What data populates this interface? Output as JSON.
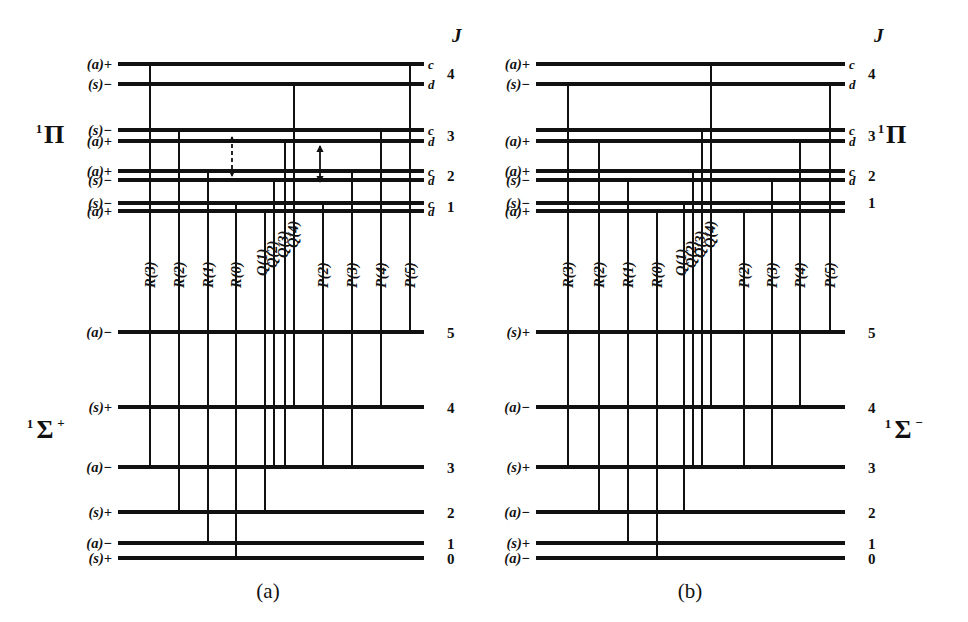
{
  "figure": {
    "caption_a": "(a)",
    "caption_b": "(b)",
    "j_header": "J",
    "axis_label_J": "J"
  },
  "panels": [
    {
      "id": "a",
      "caption": "(a)",
      "upper_term_sup": "1",
      "upper_term_symbol": "Π",
      "upper_term_charge": "",
      "lower_term_sup": "1",
      "lower_term_symbol": "Σ",
      "lower_term_charge": "+",
      "upper_levels": [
        {
          "J": "4",
          "cd": "c",
          "parity": "(a)+",
          "y": 64
        },
        {
          "J": "4",
          "cd": "d",
          "parity": "(s)−",
          "y": 84
        },
        {
          "J": "3",
          "cd": "c",
          "parity": "(s)−",
          "y": 130
        },
        {
          "J": "3",
          "cd": "d",
          "parity": "(a)+",
          "y": 141
        },
        {
          "J": "2",
          "cd": "c",
          "parity": "(a)+",
          "y": 171
        },
        {
          "J": "2",
          "cd": "d",
          "parity": "(s)−",
          "y": 180
        },
        {
          "J": "1",
          "cd": "c",
          "parity": "(s)−",
          "y": 203
        },
        {
          "J": "1",
          "cd": "d",
          "parity": "(a)+",
          "y": 211
        }
      ],
      "lower_levels": [
        {
          "J": "5",
          "parity": "(a)−",
          "y": 332
        },
        {
          "J": "4",
          "parity": "(s)+",
          "y": 407
        },
        {
          "J": "3",
          "parity": "(a)−",
          "y": 467
        },
        {
          "J": "2",
          "parity": "(s)+",
          "y": 512
        },
        {
          "J": "1",
          "parity": "(a)−",
          "y": 543
        },
        {
          "J": "0",
          "parity": "(s)+",
          "y": 558
        }
      ],
      "transitions": [
        {
          "label": "R(3)",
          "x": 150,
          "upper_y": 64,
          "lower_y": 467,
          "label_x": 150,
          "label_y": 288
        },
        {
          "label": "R(2)",
          "x": 179,
          "upper_y": 130,
          "lower_y": 512,
          "label_x": 179,
          "label_y": 288
        },
        {
          "label": "R(1)",
          "x": 208,
          "upper_y": 171,
          "lower_y": 543,
          "label_x": 208,
          "label_y": 288
        },
        {
          "label": "R(0)",
          "x": 236,
          "upper_y": 203,
          "lower_y": 558,
          "label_x": 236,
          "label_y": 288
        },
        {
          "label": "Q(1)",
          "x": 265,
          "upper_y": 211,
          "lower_y": 512,
          "label_x": 262,
          "label_y": 276
        },
        {
          "label": "Q(2)",
          "x": 274,
          "upper_y": 180,
          "lower_y": 467,
          "label_x": 272,
          "label_y": 268
        },
        {
          "label": "Q(3)",
          "x": 285,
          "upper_y": 141,
          "lower_y": 467,
          "label_x": 283,
          "label_y": 258
        },
        {
          "label": "Q(4)",
          "x": 294,
          "upper_y": 84,
          "lower_y": 407,
          "label_x": 293,
          "label_y": 248
        },
        {
          "label": "P(2)",
          "x": 323,
          "upper_y": 203,
          "lower_y": 467,
          "label_x": 323,
          "label_y": 288
        },
        {
          "label": "P(3)",
          "x": 352,
          "upper_y": 171,
          "lower_y": 467,
          "label_x": 352,
          "label_y": 288
        },
        {
          "label": "P(4)",
          "x": 381,
          "upper_y": 130,
          "lower_y": 407,
          "label_x": 381,
          "label_y": 288
        },
        {
          "label": "P(5)",
          "x": 410,
          "upper_y": 64,
          "lower_y": 332,
          "label_x": 410,
          "label_y": 288
        }
      ],
      "annotation_arrows": [
        {
          "name": "lambda-doubling-dashed-arrow",
          "x": 232,
          "y1": 137,
          "y2": 176,
          "style": "dashed"
        },
        {
          "name": "lambda-doubling-solid-arrow",
          "x": 320,
          "y1": 146,
          "y2": 182,
          "style": "solid"
        }
      ],
      "geom": {
        "level_x1": 118,
        "level_x2": 424,
        "parity_label_x": 112,
        "cd_label_x": 428,
        "jnum_label_x": 447,
        "j_header_x": 452,
        "j_header_y": 42,
        "upper_term_x": 50,
        "upper_term_y": 143,
        "lower_term_x": 42,
        "lower_term_y": 438,
        "caption_x": 268,
        "caption_y": 598
      }
    },
    {
      "id": "b",
      "caption": "(b)",
      "upper_term_sup": "1",
      "upper_term_symbol": "Π",
      "upper_term_charge": "",
      "lower_term_sup": "1",
      "lower_term_symbol": "Σ",
      "lower_term_charge": "−",
      "upper_levels": [
        {
          "J": "4",
          "cd": "c",
          "parity": "(a)+",
          "y": 64
        },
        {
          "J": "4",
          "cd": "d",
          "parity": "(s)−",
          "y": 84
        },
        {
          "J": "3",
          "cd": "c",
          "parity": "",
          "y": 130
        },
        {
          "J": "3",
          "cd": "d",
          "parity": "(a)+",
          "y": 141
        },
        {
          "J": "2",
          "cd": "c",
          "parity": "(a)+",
          "y": 171
        },
        {
          "J": "2",
          "cd": "d",
          "parity": "(s)−",
          "y": 180
        },
        {
          "J": "1",
          "cd": "",
          "parity": "(s)−",
          "y": 203
        },
        {
          "J": "",
          "cd": "",
          "parity": "(a)+",
          "y": 211
        }
      ],
      "lower_levels": [
        {
          "J": "5",
          "parity": "(s)+",
          "y": 332
        },
        {
          "J": "4",
          "parity": "(a)−",
          "y": 407
        },
        {
          "J": "3",
          "parity": "(s)+",
          "y": 467
        },
        {
          "J": "2",
          "parity": "(a)−",
          "y": 512
        },
        {
          "J": "1",
          "parity": "(s)+",
          "y": 543
        },
        {
          "J": "0",
          "parity": "(a)−",
          "y": 558
        }
      ],
      "transitions": [
        {
          "label": "R(3)",
          "x": 568,
          "upper_y": 84,
          "lower_y": 467,
          "label_x": 568,
          "label_y": 288
        },
        {
          "label": "R(2)",
          "x": 599,
          "upper_y": 141,
          "lower_y": 512,
          "label_x": 599,
          "label_y": 288
        },
        {
          "label": "R(1)",
          "x": 628,
          "upper_y": 180,
          "lower_y": 543,
          "label_x": 628,
          "label_y": 288
        },
        {
          "label": "R(0)",
          "x": 657,
          "upper_y": 211,
          "lower_y": 558,
          "label_x": 657,
          "label_y": 288
        },
        {
          "label": "Q(1)",
          "x": 684,
          "upper_y": 203,
          "lower_y": 512,
          "label_x": 681,
          "label_y": 276
        },
        {
          "label": "Q(2)",
          "x": 693,
          "upper_y": 171,
          "lower_y": 467,
          "label_x": 691,
          "label_y": 268
        },
        {
          "label": "Q(3)",
          "x": 702,
          "upper_y": 130,
          "lower_y": 467,
          "label_x": 700,
          "label_y": 258
        },
        {
          "label": "Q(4)",
          "x": 711,
          "upper_y": 64,
          "lower_y": 407,
          "label_x": 710,
          "label_y": 248
        },
        {
          "label": "P(2)",
          "x": 744,
          "upper_y": 211,
          "lower_y": 467,
          "label_x": 744,
          "label_y": 288
        },
        {
          "label": "P(3)",
          "x": 772,
          "upper_y": 180,
          "lower_y": 467,
          "label_x": 772,
          "label_y": 288
        },
        {
          "label": "P(4)",
          "x": 800,
          "upper_y": 141,
          "lower_y": 407,
          "label_x": 800,
          "label_y": 288
        },
        {
          "label": "P(5)",
          "x": 830,
          "upper_y": 84,
          "lower_y": 332,
          "label_x": 830,
          "label_y": 288
        }
      ],
      "annotation_arrows": [],
      "geom": {
        "level_x1": 536,
        "level_x2": 845,
        "parity_label_x": 530,
        "cd_label_x": 849,
        "jnum_label_x": 868,
        "j_header_x": 874,
        "j_header_y": 42,
        "upper_term_x": 892,
        "upper_term_y": 143,
        "lower_term_x": 900,
        "lower_term_y": 438,
        "caption_x": 690,
        "caption_y": 598
      }
    }
  ]
}
